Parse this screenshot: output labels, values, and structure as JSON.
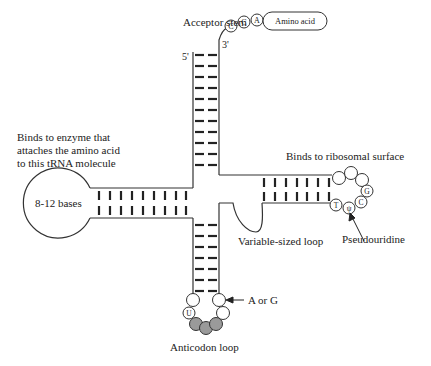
{
  "diagram": {
    "labels": {
      "acceptor_stem": "Acceptor stem",
      "five_prime": "5'",
      "three_prime": "3'",
      "amino_acid": "Amino acid",
      "d_arm_desc_line1": "Binds to enzyme that",
      "d_arm_desc_line2": "attaches the amino acid",
      "d_arm_desc_line3": "to this tRNA molecule",
      "d_loop": "8-12 bases",
      "t_arm_desc": "Binds to ribosomal surface",
      "variable_loop": "Variable-sized loop",
      "pseudouridine": "Pseudouridine",
      "a_or_g": "A or G",
      "anticodon_loop": "Anticodon loop"
    },
    "cca_tail": [
      "C",
      "C",
      "A"
    ],
    "t_loop_bases": [
      "T",
      "ψ",
      "C",
      "G"
    ],
    "anticodon_loop_bases": [
      "U"
    ],
    "colors": {
      "line": "#333333",
      "anticodon_fill": "#9a9a9a",
      "background": "#ffffff"
    },
    "stems": {
      "acceptor_base_pairs": 11,
      "d_arm_base_pairs": 9,
      "anticodon_base_pairs": 7,
      "t_arm_base_pairs": 7
    }
  }
}
